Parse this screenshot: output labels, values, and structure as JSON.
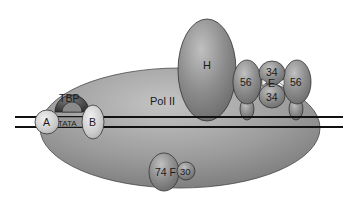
{
  "diagram": {
    "labels": {
      "pol2": "Pol II",
      "tfiih": "H",
      "tbp": "TBP",
      "tata": "TATA",
      "tfiia": "A",
      "tfiib": "B",
      "tfiie_left": "56",
      "tfiie_right": "56",
      "tfiie_top": "34",
      "tfiie_bottom": "34",
      "tfiie_center": "E",
      "tfiif_large": "74 F",
      "tfiif_small": "30"
    },
    "colors": {
      "background": "#ffffff",
      "pol2_fill": "#9a9a9a",
      "factor_fill": "#8a8a8a",
      "light_fill": "#c8c8c8",
      "tbp_fill": "#4a4a4a",
      "dna_line": "#111111",
      "outline": "#333333"
    }
  }
}
